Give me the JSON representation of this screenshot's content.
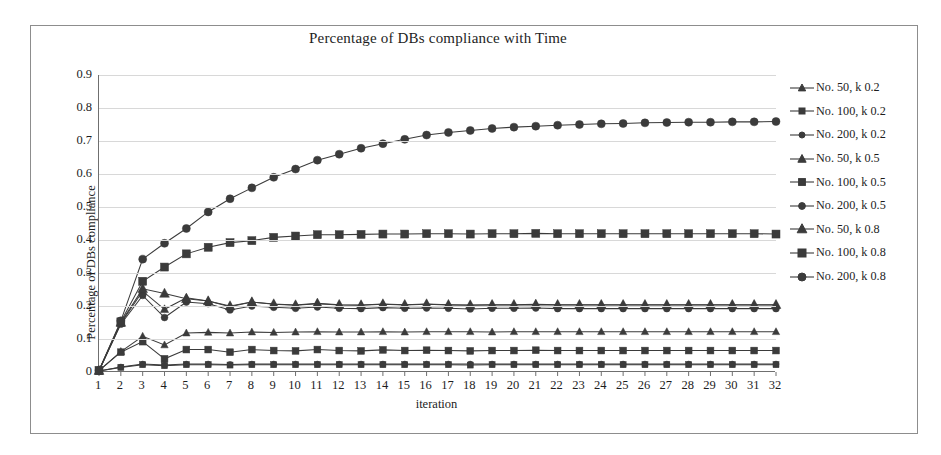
{
  "chart_data": {
    "type": "line",
    "title": "Percentage of DBs compliance with Time",
    "xlabel": "iteration",
    "ylabel": "Percentage of DBs compliance",
    "grid": true,
    "legend_position": "right",
    "xlim": [
      1,
      32
    ],
    "ylim": [
      0,
      0.9
    ],
    "ytick_labels": [
      "0.9",
      "0.8",
      "0.7",
      "0.6",
      "0.5",
      "0.4",
      "0.3",
      "0.2",
      "0.1",
      "0"
    ],
    "ytick_values": [
      0.9,
      0.8,
      0.7,
      0.6,
      0.5,
      0.4,
      0.3,
      0.2,
      0.1,
      0
    ],
    "x": [
      1,
      2,
      3,
      4,
      5,
      6,
      7,
      8,
      9,
      10,
      11,
      12,
      13,
      14,
      15,
      16,
      17,
      18,
      19,
      20,
      21,
      22,
      23,
      24,
      25,
      26,
      27,
      28,
      29,
      30,
      31,
      32
    ],
    "xtick_labels": [
      "1",
      "2",
      "3",
      "4",
      "5",
      "6",
      "7",
      "8",
      "9",
      "10",
      "11",
      "12",
      "13",
      "14",
      "15",
      "16",
      "17",
      "18",
      "19",
      "20",
      "21",
      "22",
      "23",
      "24",
      "25",
      "26",
      "27",
      "28",
      "29",
      "30",
      "31",
      "32"
    ],
    "series": [
      {
        "name": "No. 50, k 0.2",
        "marker": "triangle",
        "marker_size": 3.2,
        "color": "#3b3b3b",
        "values": [
          0.004,
          0.062,
          0.108,
          0.082,
          0.118,
          0.12,
          0.118,
          0.121,
          0.12,
          0.121,
          0.122,
          0.121,
          0.121,
          0.122,
          0.121,
          0.122,
          0.122,
          0.122,
          0.121,
          0.122,
          0.122,
          0.122,
          0.122,
          0.122,
          0.122,
          0.122,
          0.122,
          0.122,
          0.122,
          0.122,
          0.122,
          0.122
        ]
      },
      {
        "name": "No. 100, k 0.2",
        "marker": "square",
        "marker_size": 3.0,
        "color": "#3b3b3b",
        "values": [
          0.003,
          0.014,
          0.022,
          0.019,
          0.022,
          0.022,
          0.021,
          0.022,
          0.022,
          0.022,
          0.022,
          0.022,
          0.022,
          0.022,
          0.022,
          0.022,
          0.022,
          0.021,
          0.022,
          0.022,
          0.022,
          0.022,
          0.022,
          0.022,
          0.022,
          0.022,
          0.022,
          0.022,
          0.022,
          0.022,
          0.022,
          0.022
        ]
      },
      {
        "name": "No. 200, k 0.2",
        "marker": "circle",
        "marker_size": 3.0,
        "color": "#3b3b3b",
        "values": [
          0.003,
          0.015,
          0.024,
          0.021,
          0.024,
          0.024,
          0.023,
          0.024,
          0.024,
          0.024,
          0.024,
          0.024,
          0.024,
          0.024,
          0.024,
          0.024,
          0.024,
          0.024,
          0.024,
          0.024,
          0.024,
          0.024,
          0.024,
          0.024,
          0.024,
          0.024,
          0.024,
          0.024,
          0.024,
          0.024,
          0.024,
          0.024
        ]
      },
      {
        "name": "No. 50, k 0.5",
        "marker": "triangle",
        "marker_size": 3.6,
        "color": "#3b3b3b",
        "values": [
          0.004,
          0.148,
          0.245,
          0.19,
          0.225,
          0.215,
          0.198,
          0.212,
          0.205,
          0.202,
          0.207,
          0.203,
          0.202,
          0.205,
          0.203,
          0.205,
          0.203,
          0.202,
          0.203,
          0.203,
          0.204,
          0.203,
          0.203,
          0.203,
          0.203,
          0.203,
          0.203,
          0.203,
          0.203,
          0.203,
          0.203,
          0.203
        ]
      },
      {
        "name": "No. 100, k 0.5",
        "marker": "square",
        "marker_size": 3.4,
        "color": "#3b3b3b",
        "values": [
          0.004,
          0.06,
          0.092,
          0.04,
          0.068,
          0.068,
          0.06,
          0.068,
          0.065,
          0.064,
          0.068,
          0.065,
          0.064,
          0.067,
          0.065,
          0.066,
          0.065,
          0.064,
          0.065,
          0.065,
          0.066,
          0.065,
          0.065,
          0.065,
          0.065,
          0.065,
          0.065,
          0.065,
          0.065,
          0.065,
          0.065,
          0.065
        ]
      },
      {
        "name": "No. 200, k 0.5",
        "marker": "circle",
        "marker_size": 3.4,
        "color": "#3b3b3b",
        "values": [
          0.004,
          0.145,
          0.232,
          0.165,
          0.212,
          0.207,
          0.188,
          0.2,
          0.196,
          0.193,
          0.197,
          0.193,
          0.192,
          0.195,
          0.193,
          0.194,
          0.193,
          0.191,
          0.193,
          0.193,
          0.194,
          0.192,
          0.192,
          0.192,
          0.192,
          0.192,
          0.192,
          0.192,
          0.192,
          0.192,
          0.192,
          0.192
        ]
      },
      {
        "name": "No. 50, k 0.8",
        "marker": "triangle",
        "marker_size": 4.2,
        "color": "#3b3b3b",
        "values": [
          0.004,
          0.15,
          0.252,
          0.238,
          0.222,
          0.215,
          0.2,
          0.212,
          0.206,
          0.203,
          0.208,
          0.204,
          0.203,
          0.206,
          0.204,
          0.206,
          0.204,
          0.203,
          0.204,
          0.204,
          0.205,
          0.204,
          0.204,
          0.204,
          0.204,
          0.204,
          0.204,
          0.204,
          0.204,
          0.204,
          0.204,
          0.204
        ]
      },
      {
        "name": "No. 100, k 0.8",
        "marker": "square",
        "marker_size": 4.0,
        "color": "#3b3b3b",
        "values": [
          0.005,
          0.152,
          0.275,
          0.318,
          0.358,
          0.378,
          0.392,
          0.398,
          0.408,
          0.412,
          0.416,
          0.416,
          0.417,
          0.418,
          0.418,
          0.419,
          0.419,
          0.418,
          0.419,
          0.419,
          0.42,
          0.419,
          0.419,
          0.419,
          0.419,
          0.419,
          0.419,
          0.419,
          0.419,
          0.419,
          0.419,
          0.418
        ]
      },
      {
        "name": "No. 200, k 0.8",
        "marker": "circle",
        "marker_size": 4.0,
        "color": "#3b3b3b",
        "values": [
          0.005,
          0.155,
          0.342,
          0.39,
          0.435,
          0.485,
          0.525,
          0.558,
          0.59,
          0.615,
          0.642,
          0.66,
          0.678,
          0.692,
          0.705,
          0.718,
          0.726,
          0.732,
          0.738,
          0.742,
          0.745,
          0.748,
          0.75,
          0.752,
          0.753,
          0.755,
          0.756,
          0.757,
          0.757,
          0.758,
          0.758,
          0.759
        ]
      }
    ]
  }
}
